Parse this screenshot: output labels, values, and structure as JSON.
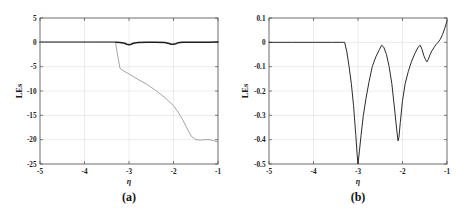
{
  "figure": {
    "panels": [
      "a",
      "b"
    ]
  },
  "chart_data": [
    {
      "type": "line",
      "panel_label": "(a)",
      "title": "",
      "xlabel": "η",
      "ylabel": "LEs",
      "xlim": [
        -5,
        -1
      ],
      "ylim": [
        -25,
        5
      ],
      "xticks": [
        -5,
        -4,
        -3,
        -2,
        -1
      ],
      "xticklabels": [
        "-5",
        "-4",
        "-3",
        "-2",
        "-1"
      ],
      "yticks": [
        5,
        0,
        -5,
        -10,
        -15,
        -20,
        -25
      ],
      "yticklabels": [
        "5",
        "0",
        "-5",
        "-10",
        "-15",
        "-20",
        "-25"
      ],
      "grid": true,
      "legend": "none",
      "series": [
        {
          "name": "LE1 (near-zero exponent)",
          "color": "#1c1c1c",
          "x": [
            -5.0,
            -4.0,
            -3.4,
            -3.3,
            -3.2,
            -3.1,
            -3.05,
            -3.0,
            -2.95,
            -2.9,
            -2.8,
            -2.6,
            -2.4,
            -2.2,
            -2.1,
            -2.05,
            -2.0,
            -1.95,
            -1.9,
            -1.8,
            -1.5,
            -1.2,
            -1.0
          ],
          "y": [
            0.0,
            0.0,
            0.0,
            0.0,
            -0.05,
            -0.2,
            -0.4,
            -0.5,
            -0.4,
            -0.2,
            -0.05,
            0.0,
            0.0,
            -0.05,
            -0.25,
            -0.38,
            -0.41,
            -0.3,
            -0.1,
            0.0,
            0.0,
            0.0,
            0.05
          ]
        },
        {
          "name": "LE2 (negative exponent)",
          "color": "#9a9a9a",
          "x": [
            -5.0,
            -4.0,
            -3.6,
            -3.4,
            -3.32,
            -3.3,
            -3.25,
            -3.2,
            -3.15,
            -3.0,
            -2.8,
            -2.6,
            -2.4,
            -2.2,
            -2.0,
            -1.9,
            -1.8,
            -1.7,
            -1.6,
            -1.5,
            -1.4,
            -1.3,
            -1.2,
            -1.1,
            -1.0
          ],
          "y": [
            0.0,
            0.0,
            0.0,
            0.0,
            0.0,
            -0.2,
            -3.0,
            -5.4,
            -5.7,
            -6.5,
            -7.6,
            -8.6,
            -9.9,
            -11.3,
            -13.0,
            -14.3,
            -15.8,
            -17.6,
            -19.3,
            -20.0,
            -20.1,
            -20.0,
            -20.0,
            -20.2,
            -20.5
          ]
        }
      ]
    },
    {
      "type": "line",
      "panel_label": "(b)",
      "title": "",
      "xlabel": "η",
      "ylabel": "LEs",
      "xlim": [
        -5,
        -1
      ],
      "ylim": [
        -0.5,
        0.1
      ],
      "xticks": [
        -5,
        -4,
        -3,
        -2,
        -1
      ],
      "xticklabels": [
        "-5",
        "-4",
        "-3",
        "-2",
        "-1"
      ],
      "yticks": [
        0.1,
        0,
        -0.1,
        -0.2,
        -0.3,
        -0.4,
        -0.5
      ],
      "yticklabels": [
        "0.1",
        "0",
        "-0.1",
        "-0.2",
        "-0.3",
        "-0.4",
        "-0.5"
      ],
      "grid": true,
      "legend": "none",
      "series": [
        {
          "name": "LE1 (zoomed near-zero exponent)",
          "color": "#2b2b2b",
          "x": [
            -5.0,
            -4.5,
            -4.0,
            -3.6,
            -3.4,
            -3.32,
            -3.3,
            -3.25,
            -3.2,
            -3.15,
            -3.1,
            -3.05,
            -3.02,
            -3.0,
            -2.97,
            -2.93,
            -2.88,
            -2.82,
            -2.75,
            -2.68,
            -2.6,
            -2.52,
            -2.47,
            -2.42,
            -2.36,
            -2.3,
            -2.24,
            -2.18,
            -2.13,
            -2.1,
            -2.08,
            -2.05,
            -2.0,
            -1.94,
            -1.87,
            -1.8,
            -1.72,
            -1.65,
            -1.6,
            -1.56,
            -1.52,
            -1.48,
            -1.45,
            -1.42,
            -1.38,
            -1.33,
            -1.28,
            -1.24,
            -1.2,
            -1.15,
            -1.1,
            -1.05,
            -1.0
          ],
          "y": [
            0.0,
            0.0,
            0.0,
            0.0,
            0.0,
            0.0,
            0.0,
            -0.04,
            -0.1,
            -0.17,
            -0.26,
            -0.38,
            -0.46,
            -0.5,
            -0.45,
            -0.38,
            -0.3,
            -0.23,
            -0.16,
            -0.1,
            -0.06,
            -0.03,
            -0.012,
            -0.02,
            -0.05,
            -0.1,
            -0.17,
            -0.27,
            -0.36,
            -0.405,
            -0.39,
            -0.33,
            -0.24,
            -0.17,
            -0.12,
            -0.08,
            -0.045,
            -0.02,
            -0.012,
            -0.03,
            -0.055,
            -0.072,
            -0.08,
            -0.07,
            -0.05,
            -0.032,
            -0.018,
            -0.008,
            0.0,
            0.013,
            0.032,
            0.058,
            0.088
          ]
        }
      ]
    }
  ]
}
